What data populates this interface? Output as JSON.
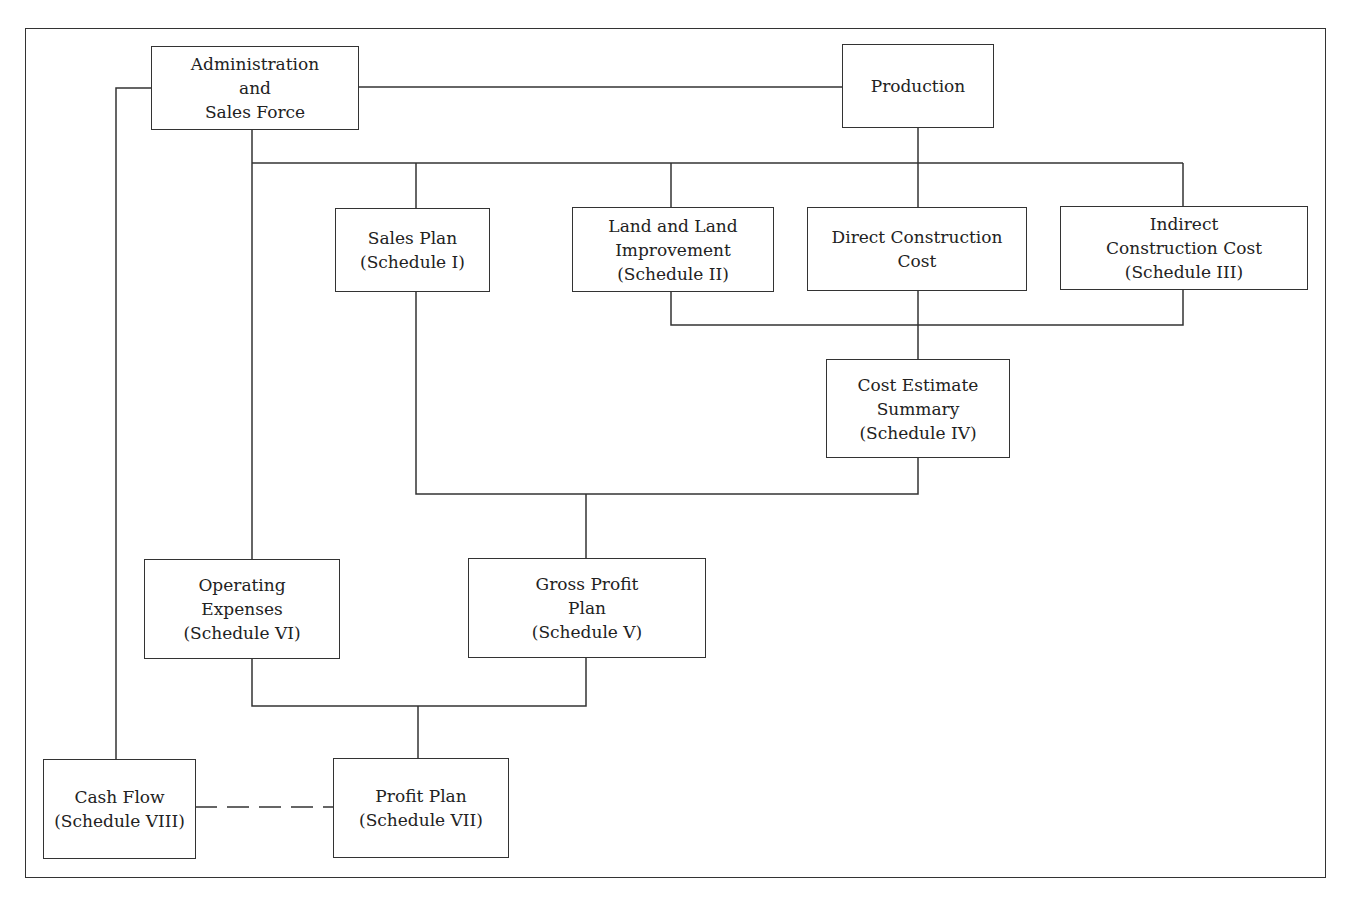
{
  "diagram": {
    "type": "flowchart",
    "nodes": {
      "admin": {
        "lines": [
          "Administration",
          "and",
          "Sales Force"
        ]
      },
      "production": {
        "lines": [
          "Production"
        ]
      },
      "sales_plan": {
        "lines": [
          "Sales Plan",
          "(Schedule I)"
        ]
      },
      "land": {
        "lines": [
          "Land and Land",
          "Improvement",
          "(Schedule II)"
        ]
      },
      "direct_cost": {
        "lines": [
          "Direct Construction",
          "Cost"
        ]
      },
      "indirect_cost": {
        "lines": [
          "Indirect",
          "Construction Cost",
          "(Schedule III)"
        ]
      },
      "cost_summary": {
        "lines": [
          "Cost Estimate",
          "Summary",
          "(Schedule IV)"
        ]
      },
      "operating_expenses": {
        "lines": [
          "Operating",
          "Expenses",
          "(Schedule VI)"
        ]
      },
      "gross_profit": {
        "lines": [
          "Gross Profit",
          "Plan",
          "(Schedule V)"
        ]
      },
      "cash_flow": {
        "lines": [
          "Cash Flow",
          "(Schedule VIII)"
        ]
      },
      "profit_plan": {
        "lines": [
          "Profit Plan",
          "(Schedule VII)"
        ]
      }
    },
    "edges": [
      {
        "from": "admin",
        "to": "production",
        "style": "solid"
      },
      {
        "from": "admin",
        "to": "sales_plan",
        "style": "solid"
      },
      {
        "from": "admin",
        "to": "operating_expenses",
        "style": "solid"
      },
      {
        "from": "admin",
        "to": "cash_flow",
        "style": "solid"
      },
      {
        "from": "production",
        "to": "land",
        "style": "solid"
      },
      {
        "from": "production",
        "to": "direct_cost",
        "style": "solid"
      },
      {
        "from": "production",
        "to": "indirect_cost",
        "style": "solid"
      },
      {
        "from": "land",
        "to": "cost_summary",
        "style": "solid"
      },
      {
        "from": "direct_cost",
        "to": "cost_summary",
        "style": "solid"
      },
      {
        "from": "indirect_cost",
        "to": "cost_summary",
        "style": "solid"
      },
      {
        "from": "sales_plan",
        "to": "gross_profit",
        "style": "solid"
      },
      {
        "from": "cost_summary",
        "to": "gross_profit",
        "style": "solid"
      },
      {
        "from": "operating_expenses",
        "to": "profit_plan",
        "style": "solid"
      },
      {
        "from": "gross_profit",
        "to": "profit_plan",
        "style": "solid"
      },
      {
        "from": "cash_flow",
        "to": "profit_plan",
        "style": "dashed"
      }
    ]
  }
}
